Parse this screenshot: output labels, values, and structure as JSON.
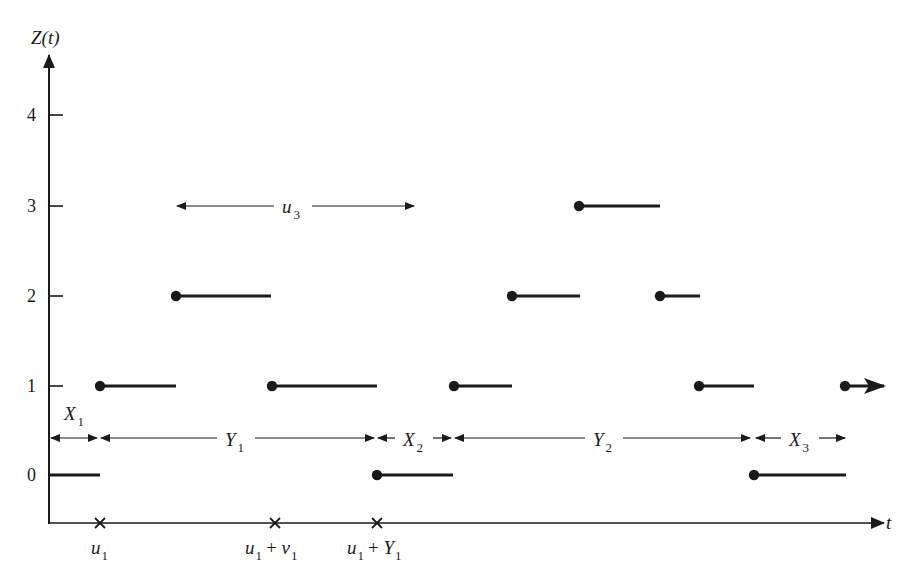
{
  "diagram": {
    "title": "",
    "y_axis": {
      "label": "Z(t)",
      "ticks": [
        {
          "value": 0,
          "label": "0",
          "y": 475
        },
        {
          "value": 1,
          "label": "1",
          "y": 386
        },
        {
          "value": 2,
          "label": "2",
          "y": 296
        },
        {
          "value": 3,
          "label": "3",
          "y": 206
        },
        {
          "value": 4,
          "label": "4",
          "y": 115
        }
      ]
    },
    "x_axis": {
      "label": "t",
      "markers": [
        {
          "id": "u1",
          "label_main": "u",
          "label_sub": "1",
          "label_suffix": "",
          "x": 100
        },
        {
          "id": "u1_plus_v1",
          "label_main": "u",
          "label_sub": "1",
          "label_suffix": "+ v",
          "label_suffix_sub": "1",
          "x": 275
        },
        {
          "id": "u1_plus_Y1",
          "label_main": "u",
          "label_sub": "1",
          "label_suffix": "+ Y",
          "label_suffix_sub": "1",
          "x": 377
        }
      ]
    },
    "steps": [
      {
        "level": 0,
        "x_start": 50,
        "x_end": 100,
        "closed_start": false
      },
      {
        "level": 1,
        "x_start": 100,
        "x_end": 176,
        "closed_start": true
      },
      {
        "level": 2,
        "x_start": 176,
        "x_end": 271,
        "closed_start": true
      },
      {
        "level": 1,
        "x_start": 272,
        "x_end": 377,
        "closed_start": true
      },
      {
        "level": 0,
        "x_start": 377,
        "x_end": 453,
        "closed_start": true
      },
      {
        "level": 1,
        "x_start": 454,
        "x_end": 512,
        "closed_start": true
      },
      {
        "level": 2,
        "x_start": 512,
        "x_end": 580,
        "closed_start": true
      },
      {
        "level": 3,
        "x_start": 579,
        "x_end": 660,
        "closed_start": true
      },
      {
        "level": 2,
        "x_start": 660,
        "x_end": 700,
        "closed_start": true
      },
      {
        "level": 1,
        "x_start": 699,
        "x_end": 754,
        "closed_start": true
      },
      {
        "level": 0,
        "x_start": 754,
        "x_end": 846,
        "closed_start": true
      },
      {
        "level": 1,
        "x_start": 845,
        "x_end": 884,
        "closed_start": true,
        "arrow_end": true
      }
    ],
    "intervals": [
      {
        "id": "X1",
        "main": "X",
        "sub": "1",
        "x_start": 50,
        "x_end": 97,
        "y": 438,
        "label_x": 64,
        "label_y": 420
      },
      {
        "id": "Y1",
        "main": "Y",
        "sub": "1",
        "x_start": 101,
        "x_end": 374,
        "y": 438,
        "label_x": 225,
        "label_y": 446
      },
      {
        "id": "X2",
        "main": "X",
        "sub": "2",
        "x_start": 378,
        "x_end": 451,
        "y": 438,
        "label_x": 403,
        "label_y": 446
      },
      {
        "id": "Y2",
        "main": "Y",
        "sub": "2",
        "x_start": 455,
        "x_end": 750,
        "y": 438,
        "label_x": 593,
        "label_y": 446
      },
      {
        "id": "X3",
        "main": "X",
        "sub": "3",
        "x_start": 756,
        "x_end": 845,
        "y": 438,
        "label_x": 789,
        "label_y": 446
      },
      {
        "id": "u3",
        "main": "u",
        "sub": "3",
        "x_start": 177,
        "x_end": 414,
        "y": 206,
        "label_x": 282,
        "label_y": 213
      }
    ]
  }
}
